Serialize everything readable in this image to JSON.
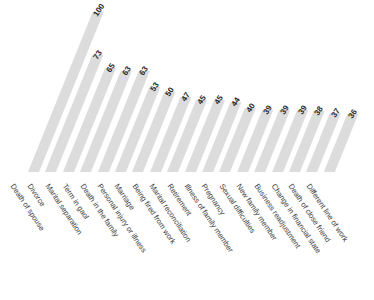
{
  "chart_data": {
    "type": "bar",
    "title": "",
    "subtitle": "",
    "xlabel": "",
    "ylabel": "",
    "ylim": [
      0,
      100
    ],
    "grid": false,
    "legend": null,
    "orientation": "vertical-skewed",
    "bar_color": "#dcdcdc",
    "value_label_color": "#1f1f1f",
    "category_label_color": "#3a3a3a",
    "categories": [
      "Death of spouse",
      "Divorce",
      "Marital separation",
      "Term in gaol",
      "Death in the family",
      "Personal injury or illness",
      "Marriage",
      "Being fired from work",
      "Marital reconciliation",
      "Retirement",
      "Illness of family member",
      "Pregnancy",
      "Sexual difficulties",
      "New family member",
      "Business readjustment",
      "Change in financial state",
      "Death of close friend",
      "Different line of work"
    ],
    "values": [
      100,
      73,
      65,
      63,
      63,
      53,
      50,
      47,
      45,
      45,
      44,
      40,
      39,
      39,
      39,
      38,
      37,
      36
    ]
  }
}
